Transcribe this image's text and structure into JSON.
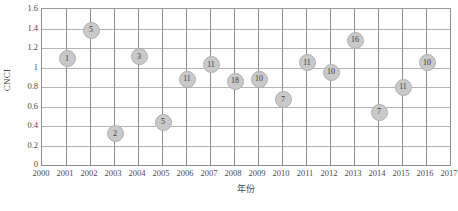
{
  "chart_data": {
    "type": "scatter",
    "title": "",
    "xlabel": "年份",
    "ylabel": "CNCI",
    "xlim": [
      2000,
      2017
    ],
    "ylim": [
      0,
      1.6
    ],
    "grid": true,
    "legend": null,
    "y_ticks": [
      "0",
      "0.2",
      "0.4",
      "0.6",
      "0.8",
      "1",
      "1.2",
      "1.4",
      "1.6"
    ],
    "y_tick_values": [
      0,
      0.2,
      0.4,
      0.6,
      0.8,
      1,
      1.2,
      1.4,
      1.6
    ],
    "x_ticks": [
      "2000",
      "2001",
      "2002",
      "2003",
      "2004",
      "2005",
      "2006",
      "2007",
      "2008",
      "2009",
      "2010",
      "2011",
      "2012",
      "2013",
      "2014",
      "2015",
      "2016",
      "2017"
    ],
    "x_tick_values": [
      2000,
      2001,
      2002,
      2003,
      2004,
      2005,
      2006,
      2007,
      2008,
      2009,
      2010,
      2011,
      2012,
      2013,
      2014,
      2015,
      2016,
      2017
    ],
    "point_label_note": "each marker is annotated with its count value",
    "points": [
      {
        "x": 2001,
        "y": 1.1,
        "label": "1"
      },
      {
        "x": 2002,
        "y": 1.39,
        "label": "5"
      },
      {
        "x": 2003,
        "y": 0.33,
        "label": "2"
      },
      {
        "x": 2004,
        "y": 1.12,
        "label": "3"
      },
      {
        "x": 2005,
        "y": 0.45,
        "label": "5"
      },
      {
        "x": 2006,
        "y": 0.89,
        "label": "11"
      },
      {
        "x": 2007,
        "y": 1.04,
        "label": "11"
      },
      {
        "x": 2008,
        "y": 0.87,
        "label": "18"
      },
      {
        "x": 2009,
        "y": 0.89,
        "label": "10"
      },
      {
        "x": 2010,
        "y": 0.68,
        "label": "7"
      },
      {
        "x": 2011,
        "y": 1.06,
        "label": "11"
      },
      {
        "x": 2012,
        "y": 0.96,
        "label": "10"
      },
      {
        "x": 2013,
        "y": 1.29,
        "label": "16"
      },
      {
        "x": 2014,
        "y": 0.55,
        "label": "7"
      },
      {
        "x": 2015,
        "y": 0.81,
        "label": "11"
      },
      {
        "x": 2016,
        "y": 1.06,
        "label": "10"
      }
    ]
  },
  "colors": {
    "marker_fill": "#c9c9c9",
    "marker_stroke": "#b0b0b0",
    "grid_major": "#8e8e8e",
    "grid_minor": "#b4b4b4",
    "text": "#3b3b3b",
    "background": "#ffffff"
  }
}
